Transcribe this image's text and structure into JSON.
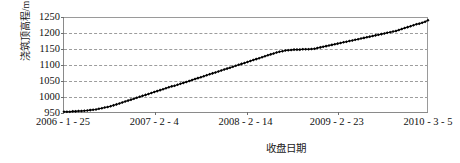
{
  "chart_data": {
    "type": "line",
    "title": "",
    "xlabel": "收盘日期",
    "ylabel": "浇筑顶高程/m",
    "grid": "horizontal-dashed",
    "legend": "none",
    "marker": "filled-diamond",
    "series_color": "#000000",
    "ylim": [
      950,
      1250
    ],
    "yticks": [
      950,
      1000,
      1050,
      1100,
      1150,
      1200,
      1250
    ],
    "ytick_labels": [
      "950",
      "1000",
      "1050",
      "1100",
      "1150",
      "1200",
      "1250"
    ],
    "xlim": [
      "2006-1-25",
      "2010-3-5"
    ],
    "xticks": [
      "2006-1-25",
      "2007-2-4",
      "2008-2-14",
      "2009-2-23",
      "2010-3-5"
    ],
    "xtick_labels": [
      "2006 - 1 - 25",
      "2007 - 2 - 4",
      "2008 - 2 - 14",
      "2009 - 2 - 23",
      "2010 - 3 - 5"
    ],
    "xtick_positions_frac": [
      0.0,
      0.25,
      0.5,
      0.75,
      1.0
    ],
    "series": [
      {
        "name": "浇筑顶高程",
        "x_frac": [
          0.0,
          0.008,
          0.016,
          0.024,
          0.032,
          0.04,
          0.048,
          0.056,
          0.064,
          0.072,
          0.08,
          0.088,
          0.096,
          0.104,
          0.112,
          0.12,
          0.128,
          0.136,
          0.144,
          0.152,
          0.16,
          0.168,
          0.176,
          0.184,
          0.192,
          0.2,
          0.208,
          0.216,
          0.224,
          0.232,
          0.24,
          0.248,
          0.256,
          0.264,
          0.272,
          0.28,
          0.288,
          0.296,
          0.304,
          0.312,
          0.32,
          0.328,
          0.336,
          0.344,
          0.352,
          0.36,
          0.368,
          0.376,
          0.384,
          0.392,
          0.4,
          0.408,
          0.416,
          0.424,
          0.432,
          0.44,
          0.448,
          0.456,
          0.464,
          0.472,
          0.48,
          0.488,
          0.496,
          0.504,
          0.512,
          0.52,
          0.528,
          0.536,
          0.544,
          0.552,
          0.56,
          0.568,
          0.576,
          0.584,
          0.592,
          0.6,
          0.608,
          0.616,
          0.624,
          0.632,
          0.64,
          0.648,
          0.656,
          0.664,
          0.672,
          0.68,
          0.688,
          0.696,
          0.704,
          0.712,
          0.72,
          0.728,
          0.736,
          0.744,
          0.752,
          0.76,
          0.768,
          0.776,
          0.784,
          0.792,
          0.8,
          0.808,
          0.816,
          0.824,
          0.832,
          0.84,
          0.848,
          0.856,
          0.864,
          0.872,
          0.88,
          0.888,
          0.896,
          0.904,
          0.912,
          0.92,
          0.928,
          0.936,
          0.944,
          0.952,
          0.96,
          0.968,
          0.976,
          0.984,
          0.992,
          1.0
        ],
        "values": [
          951,
          951,
          951,
          952,
          952,
          953,
          953,
          954,
          955,
          956,
          957,
          958,
          960,
          962,
          964,
          966,
          968,
          971,
          974,
          977,
          980,
          983,
          986,
          989,
          992,
          995,
          998,
          1001,
          1004,
          1007,
          1010,
          1013,
          1016,
          1019,
          1022,
          1025,
          1028,
          1031,
          1033,
          1036,
          1039,
          1042,
          1045,
          1048,
          1051,
          1054,
          1057,
          1060,
          1063,
          1066,
          1069,
          1072,
          1075,
          1078,
          1081,
          1084,
          1087,
          1090,
          1093,
          1096,
          1099,
          1102,
          1105,
          1108,
          1111,
          1114,
          1117,
          1120,
          1123,
          1126,
          1129,
          1132,
          1135,
          1138,
          1140,
          1142,
          1144,
          1145,
          1146,
          1147,
          1147,
          1147,
          1148,
          1148,
          1148,
          1149,
          1150,
          1152,
          1154,
          1156,
          1158,
          1160,
          1162,
          1164,
          1166,
          1168,
          1170,
          1172,
          1174,
          1176,
          1178,
          1180,
          1182,
          1184,
          1186,
          1188,
          1190,
          1192,
          1194,
          1196,
          1198,
          1200,
          1202,
          1204,
          1206,
          1209,
          1212,
          1215,
          1218,
          1221,
          1224,
          1227,
          1229,
          1232,
          1235,
          1240
        ]
      }
    ]
  }
}
